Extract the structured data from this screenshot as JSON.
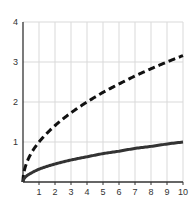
{
  "chart_data": {
    "type": "line",
    "title": "",
    "xlabel": "",
    "ylabel": "",
    "xlim": [
      0,
      10
    ],
    "ylim": [
      0,
      4
    ],
    "grid": true,
    "legend": null,
    "x_ticks": [
      "1",
      "2",
      "3",
      "4",
      "5",
      "6",
      "7",
      "8",
      "9",
      "10"
    ],
    "y_ticks": [
      "1",
      "2",
      "3",
      "4"
    ],
    "x": [
      0,
      0.25,
      0.5,
      1,
      1.5,
      2,
      3,
      4,
      5,
      6,
      7,
      8,
      9,
      10
    ],
    "series": [
      {
        "name": "dashed curve",
        "style": "dashed",
        "color": "#111111",
        "values": [
          0,
          0.5,
          0.71,
          1.0,
          1.22,
          1.41,
          1.73,
          2.0,
          2.24,
          2.45,
          2.65,
          2.83,
          3.0,
          3.16
        ]
      },
      {
        "name": "solid curve",
        "style": "solid",
        "color": "#333333",
        "values": [
          0,
          0.16,
          0.22,
          0.32,
          0.39,
          0.45,
          0.55,
          0.63,
          0.71,
          0.77,
          0.84,
          0.89,
          0.95,
          1.0
        ]
      }
    ]
  },
  "colors": {
    "grid": "#d9d9d9",
    "axis": "#333333"
  }
}
